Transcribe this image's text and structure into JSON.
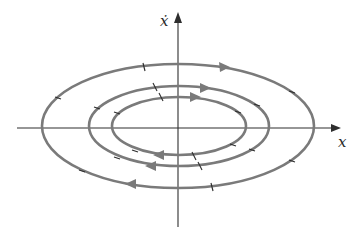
{
  "diagram": {
    "type": "phase-portrait",
    "axes": {
      "x_label": "x",
      "y_label": "ẋ"
    },
    "colors": {
      "orbit": "#7a7a7a",
      "axis": "#2e2e2e",
      "background": "#ffffff"
    },
    "orbits": [
      {
        "name": "inner",
        "rx": 67,
        "ry": 29,
        "direction": "clockwise"
      },
      {
        "name": "middle",
        "rx": 90,
        "ry": 40,
        "direction": "clockwise"
      },
      {
        "name": "outer",
        "rx": 136,
        "ry": 62,
        "direction": "clockwise"
      }
    ]
  }
}
